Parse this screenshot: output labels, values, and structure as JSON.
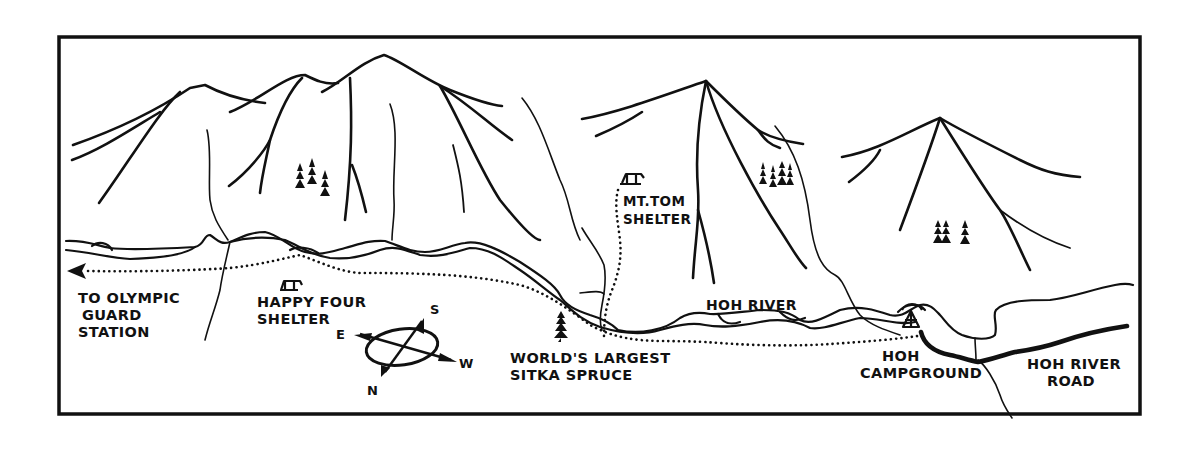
{
  "map": {
    "title": "Hoh River Trail map",
    "ink_color": "#111111",
    "paper_color": "#ffffff",
    "labels": {
      "olympic_guard": [
        "TO OLYMPIC",
        "GUARD",
        "STATION"
      ],
      "happy_four": [
        "HAPPY FOUR",
        "SHELTER"
      ],
      "mt_tom": [
        "MT.TOM",
        "SHELTER"
      ],
      "hoh_river": "HOH RIVER",
      "sitka_spruce": [
        "WORLD'S LARGEST",
        "SITKA SPRUCE"
      ],
      "hoh_campground": [
        "HOH",
        "CAMPGROUND"
      ],
      "hoh_river_road": [
        "HOH RIVER",
        "ROAD"
      ]
    },
    "compass": {
      "north": "N",
      "south": "S",
      "east": "E",
      "west": "W"
    },
    "icons": {
      "shelters": [
        "shelter-icon",
        "shelter-icon"
      ],
      "campground": "tent-icon",
      "trees": "conifer-tree-icon",
      "direction_arrow": "arrow-left-icon"
    }
  }
}
